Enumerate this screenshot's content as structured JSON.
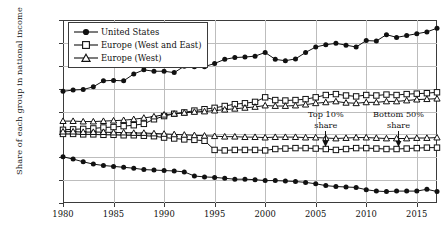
{
  "chart_data": {
    "type": "line",
    "title": "",
    "xlabel": "",
    "ylabel": "Share of each group in national income",
    "xlim": [
      1980,
      2017
    ],
    "ylim": [
      10,
      50
    ],
    "ytick_labels": [
      "50%",
      "45%",
      "40%",
      "35%",
      "30%",
      "25%",
      "20%",
      "15%",
      "10%"
    ],
    "ytick_values": [
      50,
      45,
      40,
      35,
      30,
      25,
      20,
      15,
      10
    ],
    "xtick_labels": [
      "1980",
      "1985",
      "1990",
      "1995",
      "2000",
      "2005",
      "2010",
      "2015"
    ],
    "xtick_values": [
      1980,
      1985,
      1990,
      1995,
      2000,
      2005,
      2010,
      2015
    ],
    "grid": true,
    "legend_position": "top-left",
    "legend": [
      {
        "name": "United States",
        "marker": "filled-circle"
      },
      {
        "name": "Europe (West and East)",
        "marker": "open-square"
      },
      {
        "name": "Europe (West)",
        "marker": "open-triangle"
      }
    ],
    "annotations": [
      {
        "text_line1": "Top 10%",
        "text_line2": "share",
        "x": 2006.0,
        "y": 30.6,
        "arrow": true
      },
      {
        "text_line1": "Bottom 50%",
        "text_line2": "share",
        "x": 2013.2,
        "y": 30.6,
        "arrow": true
      }
    ],
    "x": [
      1980,
      1981,
      1982,
      1983,
      1984,
      1985,
      1986,
      1987,
      1988,
      1989,
      1990,
      1991,
      1992,
      1993,
      1994,
      1995,
      1996,
      1997,
      1998,
      1999,
      2000,
      2001,
      2002,
      2003,
      2004,
      2005,
      2006,
      2007,
      2008,
      2009,
      2010,
      2011,
      2012,
      2013,
      2014,
      2015,
      2016,
      2017
    ],
    "series": [
      {
        "name": "United States",
        "group": "Top 10% share",
        "marker": "filled-circle",
        "values": [
          34.4,
          34.7,
          34.8,
          35.4,
          36.7,
          36.8,
          36.7,
          38.2,
          39.1,
          38.8,
          38.8,
          38.5,
          39.9,
          39.8,
          39.8,
          40.5,
          41.4,
          41.8,
          41.9,
          42.1,
          42.9,
          41.4,
          41.1,
          41.5,
          42.9,
          44.1,
          44.6,
          44.9,
          44.5,
          44.1,
          45.5,
          45.4,
          46.8,
          46.2,
          46.6,
          47.0,
          47.4,
          48.2
        ]
      },
      {
        "name": "United States",
        "group": "Bottom 50% share",
        "marker": "filled-circle",
        "values": [
          20.1,
          19.6,
          19.0,
          18.5,
          18.2,
          18.0,
          17.8,
          17.6,
          17.3,
          17.2,
          17.1,
          17.0,
          16.8,
          15.9,
          15.7,
          15.6,
          15.4,
          15.2,
          15.2,
          15.1,
          14.9,
          14.9,
          14.8,
          14.7,
          14.5,
          14.2,
          13.8,
          13.6,
          13.5,
          13.4,
          12.9,
          12.6,
          12.5,
          12.6,
          12.6,
          12.6,
          13.0,
          12.5
        ]
      },
      {
        "name": "Europe (West and East)",
        "group": "Top 10% share",
        "marker": "open-square",
        "values": [
          26.0,
          26.1,
          26.2,
          26.3,
          26.5,
          26.6,
          26.8,
          27.0,
          27.3,
          28.3,
          29.0,
          29.5,
          29.8,
          30.2,
          30.5,
          30.8,
          31.2,
          31.6,
          31.8,
          32.1,
          33.1,
          32.5,
          32.4,
          32.5,
          32.7,
          33.1,
          33.6,
          33.8,
          33.5,
          33.3,
          33.6,
          33.5,
          33.7,
          33.6,
          33.8,
          33.9,
          34.0,
          34.2
        ]
      },
      {
        "name": "Europe (West and East)",
        "group": "Bottom 50% share",
        "marker": "open-square",
        "values": [
          25.1,
          25.1,
          25.0,
          25.0,
          24.9,
          24.9,
          24.8,
          24.8,
          24.7,
          24.6,
          24.3,
          24.1,
          23.9,
          23.8,
          23.6,
          21.6,
          21.5,
          21.6,
          21.6,
          21.6,
          21.5,
          21.8,
          21.9,
          22.0,
          22.0,
          21.9,
          21.8,
          21.6,
          21.8,
          22.0,
          22.0,
          21.9,
          21.8,
          21.8,
          21.9,
          22.0,
          22.1,
          22.1
        ]
      },
      {
        "name": "Europe (West)",
        "group": "Top 10% share",
        "marker": "open-triangle",
        "values": [
          27.9,
          27.9,
          27.8,
          27.8,
          27.9,
          28.0,
          28.1,
          28.3,
          28.6,
          28.9,
          29.3,
          29.5,
          29.7,
          29.9,
          30.0,
          30.2,
          30.4,
          30.6,
          30.8,
          31.0,
          31.3,
          31.2,
          31.2,
          31.3,
          31.5,
          31.8,
          32.0,
          32.2,
          31.9,
          31.8,
          32.0,
          32.0,
          32.2,
          32.2,
          32.4,
          32.6,
          32.7,
          32.8
        ]
      },
      {
        "name": "Europe (West)",
        "group": "Bottom 50% share",
        "marker": "open-triangle",
        "values": [
          25.6,
          25.6,
          25.5,
          25.5,
          25.5,
          25.4,
          25.4,
          25.3,
          25.3,
          25.2,
          25.1,
          25.0,
          24.9,
          24.8,
          24.7,
          24.6,
          24.5,
          24.5,
          24.4,
          24.4,
          24.3,
          24.4,
          24.4,
          24.4,
          24.3,
          24.3,
          24.2,
          24.1,
          24.2,
          24.3,
          24.3,
          24.2,
          24.1,
          24.1,
          24.1,
          24.2,
          24.2,
          24.3
        ]
      }
    ],
    "colors": {
      "line": "#111111",
      "grid": "#bdbdbd",
      "axis": "#3b3b3b",
      "marker_fill": "#ffffff"
    }
  }
}
